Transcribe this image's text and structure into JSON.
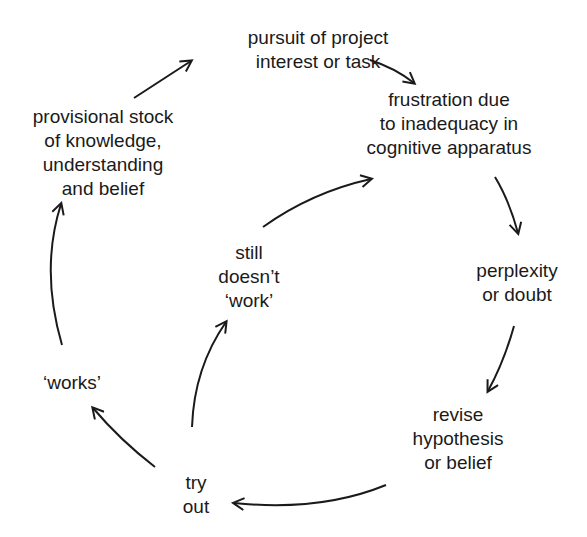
{
  "diagram": {
    "type": "cycle",
    "nodes": {
      "pursuit": {
        "lines": [
          "pursuit of project",
          "interest or task"
        ]
      },
      "frustration": {
        "lines": [
          "frustration due",
          "to inadequacy in",
          "cognitive apparatus"
        ]
      },
      "perplexity": {
        "lines": [
          "perplexity",
          "or doubt"
        ]
      },
      "revise": {
        "lines": [
          "revise",
          "hypothesis",
          "or belief"
        ]
      },
      "try_out": {
        "lines": [
          "try",
          "out"
        ]
      },
      "works": {
        "lines": [
          "‘works’"
        ]
      },
      "still_doesnt_work": {
        "lines": [
          "still",
          "doesn’t",
          "‘work’"
        ]
      },
      "provisional": {
        "lines": [
          "provisional stock",
          "of knowledge,",
          "understanding",
          "and belief"
        ]
      }
    },
    "edges": [
      {
        "from": "provisional",
        "to": "pursuit"
      },
      {
        "from": "pursuit",
        "to": "frustration"
      },
      {
        "from": "frustration",
        "to": "perplexity"
      },
      {
        "from": "perplexity",
        "to": "revise"
      },
      {
        "from": "revise",
        "to": "try_out"
      },
      {
        "from": "try_out",
        "to": "works"
      },
      {
        "from": "try_out",
        "to": "still_doesnt_work"
      },
      {
        "from": "still_doesnt_work",
        "to": "frustration"
      },
      {
        "from": "works",
        "to": "provisional"
      }
    ],
    "colors": {
      "ink": "#1a1a1a",
      "background": "#ffffff"
    }
  }
}
